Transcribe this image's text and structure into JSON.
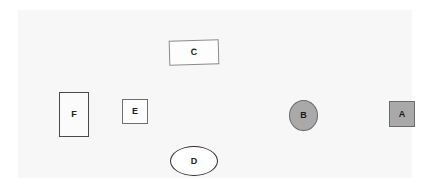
{
  "canvas": {
    "background_color": "#f7f7f7",
    "page_background_color": "#ffffff",
    "width": 394,
    "height": 168
  },
  "shapes": [
    {
      "id": "a",
      "label": "A",
      "kind": "square",
      "fill": "#a9a9a9",
      "stroke": "#6b6b6b",
      "x": 371,
      "y": 91,
      "width": 26,
      "height": 26
    },
    {
      "id": "b",
      "label": "B",
      "kind": "ellipse",
      "fill": "#a9a9a9",
      "stroke": "#6b6b6b",
      "x": 271,
      "y": 90,
      "width": 29,
      "height": 31
    },
    {
      "id": "c",
      "label": "C",
      "kind": "rectangle",
      "fill": "#fdfdfd",
      "stroke": "#8a8a8a",
      "x": 151,
      "y": 30,
      "width": 50,
      "height": 25,
      "rotation": -1.6
    },
    {
      "id": "d",
      "label": "D",
      "kind": "ellipse",
      "fill": "#ffffff",
      "stroke": "#2e2e2e",
      "x": 152,
      "y": 136,
      "width": 48,
      "height": 30
    },
    {
      "id": "e",
      "label": "E",
      "kind": "square",
      "fill": "#fdfdfd",
      "stroke": "#6f6f6f",
      "x": 104,
      "y": 89,
      "width": 26,
      "height": 25
    },
    {
      "id": "f",
      "label": "F",
      "kind": "rectangle",
      "fill": "#fbfbfb",
      "stroke": "#4a4a4a",
      "x": 41,
      "y": 82,
      "width": 30,
      "height": 45
    }
  ]
}
